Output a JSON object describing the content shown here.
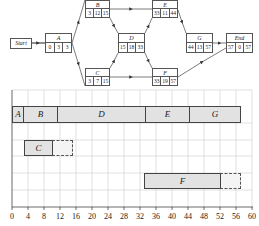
{
  "network": {
    "start": {
      "label": "Start"
    },
    "nodes": [
      {
        "id": "A",
        "es": "0",
        "dur": "3",
        "ef": "3"
      },
      {
        "id": "B",
        "es": "3",
        "dur": "12",
        "ef": "15"
      },
      {
        "id": "C",
        "es": "3",
        "dur": "7",
        "ef": "15"
      },
      {
        "id": "D",
        "es": "15",
        "dur": "18",
        "ef": "33"
      },
      {
        "id": "E",
        "es": "33",
        "dur": "11",
        "ef": "44"
      },
      {
        "id": "F",
        "es": "33",
        "dur": "19",
        "ef": "57"
      },
      {
        "id": "G",
        "es": "44",
        "dur": "13",
        "ef": "57"
      },
      {
        "id": "End",
        "es": "57",
        "dur": "0",
        "ef": "57"
      }
    ],
    "edges": [
      [
        "Start",
        "A"
      ],
      [
        "A",
        "B"
      ],
      [
        "A",
        "C"
      ],
      [
        "B",
        "D"
      ],
      [
        "C",
        "D"
      ],
      [
        "B",
        "E"
      ],
      [
        "C",
        "F"
      ],
      [
        "D",
        "E"
      ],
      [
        "D",
        "F"
      ],
      [
        "E",
        "G"
      ],
      [
        "G",
        "End"
      ],
      [
        "F",
        "End"
      ]
    ]
  },
  "gantt": {
    "xaxis": {
      "min": 0,
      "max": 60,
      "step": 4,
      "ticks": [
        "0",
        "4",
        "8",
        "12",
        "16",
        "20",
        "24",
        "28",
        "32",
        "36",
        "40",
        "44",
        "48",
        "52",
        "56",
        "60"
      ]
    },
    "rows": [
      {
        "bars": [
          {
            "label": "A",
            "start": 0,
            "end": 3
          },
          {
            "label": "B",
            "start": 3,
            "end": 11
          },
          {
            "label": "D",
            "start": 11,
            "end": 33
          },
          {
            "label": "E",
            "start": 33,
            "end": 44
          },
          {
            "label": "G",
            "start": 44,
            "end": 57
          }
        ]
      },
      {
        "bars": [
          {
            "label": "C",
            "start": 3,
            "end": 10
          }
        ],
        "slack": {
          "start": 10,
          "end": 15
        }
      },
      {
        "bars": [
          {
            "label": "F",
            "start": 33,
            "end": 52
          }
        ],
        "slack": {
          "start": 52,
          "end": 57
        }
      }
    ]
  },
  "colors": {
    "bar_fill": "#e2e2e2",
    "grid": "#cccccc",
    "line": "#444444"
  }
}
